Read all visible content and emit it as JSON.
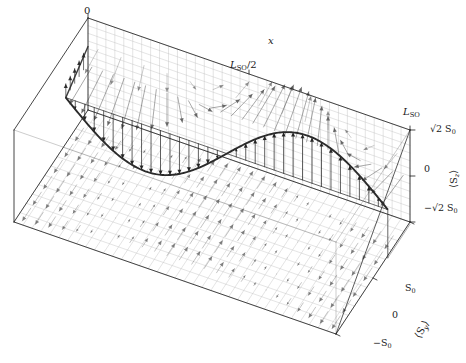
{
  "figure": {
    "type": "3d-vector-field-plot",
    "title": "",
    "background_color": "#ffffff",
    "ink_color": "#1a1a1a",
    "grid_color": "#b9b9b9",
    "arrow_color": "#555555",
    "curve_color": "#2a2a2a"
  },
  "axes": {
    "x": {
      "label": "x",
      "ticks": [
        {
          "text_html": "0",
          "value": 0
        },
        {
          "text_html": "L<sub>SO</sub>/2",
          "value": 0.5
        },
        {
          "text_html": "L<sub>SO</sub>",
          "value": 1
        }
      ]
    },
    "z_right": {
      "label_html": "&lang;S<sub>z</sub>&rang;",
      "ticks": [
        {
          "text_html": "&radic;2 S<sub>0</sub>",
          "value": 1.4142
        },
        {
          "text_html": "0",
          "value": 0
        },
        {
          "text_html": "&minus;&radic;2 S<sub>0</sub>",
          "value": -1.4142
        }
      ]
    },
    "y_bottom": {
      "label_html": "&lang;S<sub>y</sub>&rang;",
      "ticks": [
        {
          "text_html": "S<sub>0</sub>",
          "value": 1
        },
        {
          "text_html": "0",
          "value": 0
        },
        {
          "text_html": "&minus;S<sub>0</sub>",
          "value": -1
        }
      ]
    }
  },
  "labels": {
    "x_axis": "x",
    "x_tick_0": "0",
    "x_tick_half_main": "L",
    "x_tick_half_sub": "SO",
    "x_tick_half_rest": "/2",
    "x_tick_full_main": "L",
    "x_tick_full_sub": "SO",
    "z_top": "√2 S",
    "z_top_sub": "0",
    "z_mid": "0",
    "z_bot": "−√2 S",
    "z_bot_sub": "0",
    "y_top": "S",
    "y_top_sub": "0",
    "y_mid": "0",
    "y_bot": "−S",
    "y_bot_sub": "0",
    "sz_axis_main": "⟨S",
    "sz_axis_sub": "z",
    "sz_axis_end": "⟩",
    "sy_axis_main": "⟨S",
    "sy_axis_sub": "y",
    "sy_axis_end": "⟩"
  },
  "chart_data": {
    "type": "line",
    "title": "",
    "xlabel": "x",
    "ylabel": "<S_z>",
    "xlim": [
      0,
      1
    ],
    "ylim": [
      -1.4142,
      1.4142
    ],
    "grid": true,
    "legend": "none",
    "xtick_labels": [
      "0",
      "L_SO/2",
      "L_SO"
    ],
    "xtick_values": [
      0,
      0.5,
      1
    ],
    "ytick_labels": [
      "sqrt(2) S_0",
      "0",
      "-sqrt(2) S_0"
    ],
    "ytick_values": [
      1.4142,
      0,
      -1.4142
    ],
    "bottom_axis_tick_labels": [
      "S_0",
      "0",
      "-S_0"
    ],
    "bottom_axis_tick_values": [
      1,
      0,
      -1
    ],
    "series": [
      {
        "name": "<S_z>(x)",
        "description": "spin z-component, one full sinusoidal period of amplitude sqrt(2) S_0 over L_SO, negative lobe first",
        "x": [
          0.0,
          0.05,
          0.1,
          0.15,
          0.2,
          0.25,
          0.3,
          0.35,
          0.4,
          0.45,
          0.5,
          0.55,
          0.6,
          0.65,
          0.7,
          0.75,
          0.8,
          0.85,
          0.9,
          0.95,
          1.0
        ],
        "values": [
          0.0,
          -0.437,
          -0.831,
          -1.143,
          -1.345,
          -1.414,
          -1.345,
          -1.143,
          -0.831,
          -0.437,
          0.0,
          0.437,
          0.831,
          1.143,
          1.345,
          1.414,
          1.345,
          1.143,
          0.831,
          0.437,
          0.0
        ]
      },
      {
        "name": "<S_y>(x)",
        "description": "in-plane spin component on the bottom plane, cosine of amplitude S_0",
        "x": [
          0.0,
          0.05,
          0.1,
          0.15,
          0.2,
          0.25,
          0.3,
          0.35,
          0.4,
          0.45,
          0.5,
          0.55,
          0.6,
          0.65,
          0.7,
          0.75,
          0.8,
          0.85,
          0.9,
          0.95,
          1.0
        ],
        "values": [
          1.0,
          0.951,
          0.809,
          0.588,
          0.309,
          0.0,
          -0.309,
          -0.588,
          -0.809,
          -0.951,
          -1.0,
          -0.951,
          -0.809,
          -0.588,
          -0.309,
          0.0,
          0.309,
          0.588,
          0.809,
          0.951,
          1.0
        ]
      }
    ],
    "vector_fields": [
      {
        "name": "back-plane-spin-rotation",
        "plane": "back (x-z)",
        "description": "arrows rotating continuously through 2 pi across x, fanning out from the plane"
      },
      {
        "name": "bottom-plane-spin-rotation",
        "plane": "bottom (x-y)",
        "description": "arrows rotating continuously through 2 pi across x, lying in the bottom plane"
      },
      {
        "name": "curve-arrows",
        "plane": "mid (x-z)",
        "description": "vertical arrows from the zero line up/down to the sinusoidal <S_z> curve"
      }
    ]
  }
}
